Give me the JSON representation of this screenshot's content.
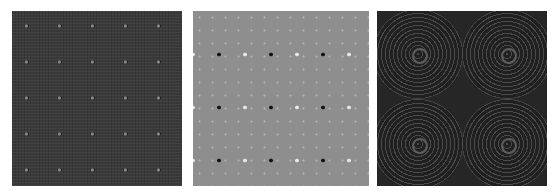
{
  "panels": [
    {
      "id": "panel-1",
      "description": "dark grey textured lattice pattern with faint periodic dots",
      "background": "#3a3a3a"
    },
    {
      "id": "panel-2",
      "description": "medium grey field with regular grid of alternating black and white dots",
      "background": "#8e8e8e"
    },
    {
      "id": "panel-3",
      "description": "dark field with four sets of concentric ring patterns",
      "background": "#262626"
    }
  ]
}
